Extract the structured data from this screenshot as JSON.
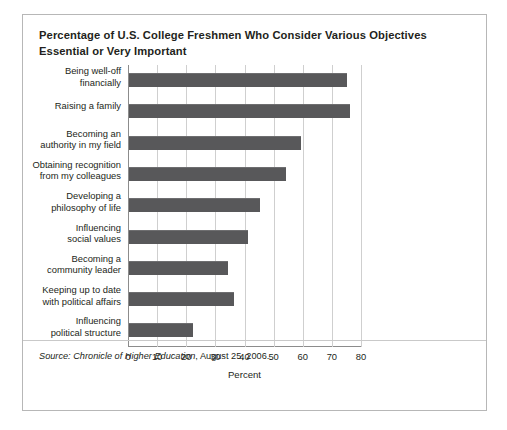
{
  "figure": {
    "title": "Percentage of U.S. College Freshmen Who Consider Various Objectives Essential or Very Important",
    "source_prefix": "Source:",
    "source_publication": "Chronicle of Higher Education",
    "source_rest": ", August 25, 2006."
  },
  "chart_data": {
    "type": "bar",
    "orientation": "horizontal",
    "title": "Percentage of U.S. College Freshmen Who Consider Various Objectives Essential or Very Important",
    "xlabel": "Percent",
    "ylabel": "",
    "xlim": [
      0,
      80
    ],
    "xticks": [
      0,
      10,
      20,
      30,
      40,
      50,
      60,
      70,
      80
    ],
    "grid": "vertical",
    "legend": "none",
    "bar_color": "#58585a",
    "categories": [
      "Being well-off\nfinancially",
      "Raising a family",
      "Becoming an\nauthority in my field",
      "Obtaining recognition\nfrom my colleagues",
      "Developing a\nphilosophy of life",
      "Influencing\nsocial values",
      "Becoming a\ncommunity leader",
      "Keeping up to date\nwith political affairs",
      "Influencing\npolitical structure"
    ],
    "values": [
      75,
      76,
      59,
      54,
      45,
      41,
      34,
      36,
      22
    ]
  }
}
